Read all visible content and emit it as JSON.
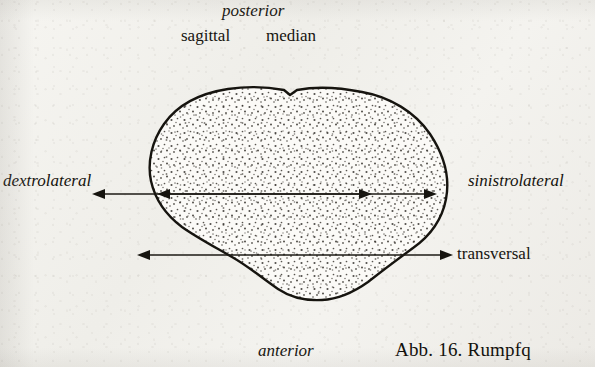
{
  "figure": {
    "kind": "anatomical-cross-section-diagram",
    "background_color": "#f2f1ec",
    "ink_color": "#16140f"
  },
  "labels": {
    "posterior": "posterior",
    "anterior": "anterior",
    "dextrolateral": "dextrolateral",
    "sinistrolateral": "sinistrolateral",
    "sagittal": "sagittal",
    "median": "median",
    "transversal": "transversal"
  },
  "caption": {
    "text": "Abb. 16. Rumpfq",
    "note_clipped": "clipped at right image edge"
  },
  "axes": [
    {
      "name": "sagittal",
      "orientation": "vertical",
      "x": 232,
      "y_start": 55,
      "y_end": 333,
      "arrowheads": "both"
    },
    {
      "name": "median",
      "orientation": "vertical",
      "x": 297,
      "y_start": 55,
      "y_end": 333,
      "arrowheads": "both"
    },
    {
      "name": "transversal",
      "orientation": "horizontal",
      "y": 255,
      "x_start": 138,
      "x_end": 452,
      "arrowheads": "both"
    }
  ],
  "body_outline": {
    "left_edge_x": 149,
    "right_edge_x": 448,
    "top_edge_y": 88,
    "bottom_edge_y": 298,
    "fill": "stippled",
    "stroke_width": 2.4,
    "notch_at_median_top": true
  }
}
